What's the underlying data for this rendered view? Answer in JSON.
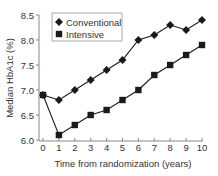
{
  "chart_data": {
    "type": "line",
    "title": "",
    "xlabel": "Time from randomization (years)",
    "ylabel": "Median HbA1c (%)",
    "x": [
      0,
      1,
      2,
      3,
      4,
      5,
      6,
      7,
      8,
      9,
      10
    ],
    "xticks": [
      "0",
      "1",
      "2",
      "3",
      "4",
      "5",
      "6",
      "7",
      "8",
      "9",
      "10"
    ],
    "yticks": [
      "6.0",
      "6.5",
      "7.0",
      "7.5",
      "8.0",
      "8.5"
    ],
    "xlim": [
      0,
      10
    ],
    "ylim": [
      6.0,
      8.5
    ],
    "grid": false,
    "legend_position": "upper left",
    "series": [
      {
        "name": "Conventional",
        "marker": "diamond",
        "values": [
          6.9,
          6.8,
          7.0,
          7.2,
          7.4,
          7.6,
          8.0,
          8.1,
          8.3,
          8.2,
          8.4
        ]
      },
      {
        "name": "Intensive",
        "marker": "square",
        "values": [
          6.9,
          6.1,
          6.3,
          6.5,
          6.6,
          6.8,
          7.0,
          7.3,
          7.5,
          7.7,
          7.9
        ]
      }
    ]
  },
  "colors": {
    "line": "#1a1a1a",
    "axis": "#888888",
    "text": "#333333",
    "legend_border": "#aaaaaa"
  }
}
